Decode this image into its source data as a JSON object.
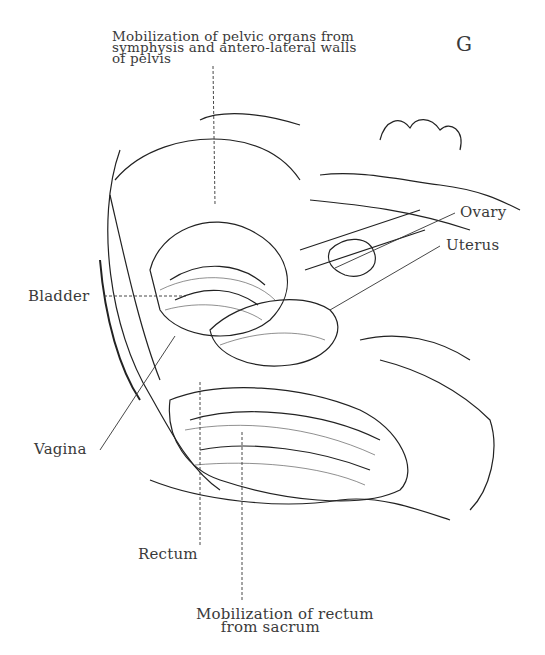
{
  "figure": {
    "plate_letter": "G",
    "labels": {
      "top": "Mobilization of pelvic organs from\nsymphysis and antero-lateral walls\nof pelvis",
      "ovary": "Ovary",
      "uterus": "Uterus",
      "bladder": "Bladder",
      "vagina": "Vagina",
      "rectum": "Rectum",
      "bottom": "Mobilization of rectum\n     from sacrum"
    }
  }
}
